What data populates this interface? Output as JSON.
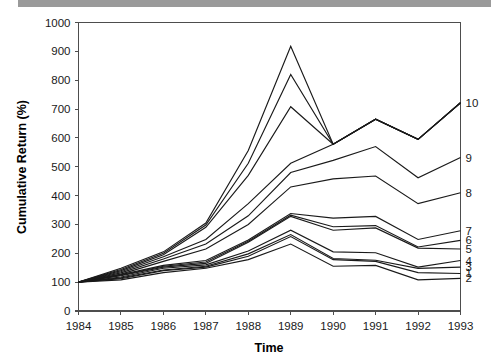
{
  "chart_data": {
    "type": "line",
    "title": "",
    "xlabel": "Time",
    "ylabel": "Cumulative Return (%)",
    "x": [
      1984,
      1985,
      1986,
      1987,
      1988,
      1989,
      1990,
      1991,
      1992,
      1993
    ],
    "categories": [
      "1984",
      "1985",
      "1986",
      "1987",
      "1988",
      "1989",
      "1990",
      "1991",
      "1992",
      "1993"
    ],
    "xticklabels": [
      "1984",
      "1985",
      "1986",
      "1987",
      "1988",
      "1989",
      "1990",
      "1991",
      "1992",
      "1993"
    ],
    "yticklabels": [
      "0",
      "100",
      "200",
      "300",
      "400",
      "500",
      "600",
      "700",
      "800",
      "900",
      "1000"
    ],
    "yticks": [
      0,
      100,
      200,
      300,
      400,
      500,
      600,
      700,
      800,
      900,
      1000
    ],
    "ylim": [
      0,
      1000
    ],
    "xlim": [
      1984,
      1993
    ],
    "grid": false,
    "legend_position": "right-edge-labels",
    "series": [
      {
        "name": "1",
        "label": "1",
        "label_value": 130,
        "values": [
          100,
          112,
          140,
          152,
          190,
          258,
          178,
          172,
          133,
          130
        ]
      },
      {
        "name": "2",
        "label": "2",
        "label_value": 113,
        "values": [
          100,
          108,
          133,
          148,
          178,
          232,
          155,
          158,
          108,
          113
        ]
      },
      {
        "name": "3",
        "label": "3",
        "label_value": 152,
        "values": [
          100,
          115,
          142,
          155,
          198,
          265,
          182,
          176,
          148,
          152
        ]
      },
      {
        "name": "4",
        "label": "4",
        "label_value": 175,
        "values": [
          100,
          118,
          148,
          160,
          208,
          280,
          205,
          202,
          152,
          175
        ]
      },
      {
        "name": "5",
        "label": "5",
        "label_value": 215,
        "values": [
          100,
          122,
          152,
          165,
          238,
          328,
          280,
          288,
          218,
          215
        ]
      },
      {
        "name": "6",
        "label": "6",
        "label_value": 245,
        "values": [
          100,
          124,
          155,
          170,
          242,
          332,
          292,
          296,
          222,
          245
        ]
      },
      {
        "name": "7",
        "label": "7",
        "label_value": 278,
        "values": [
          100,
          126,
          158,
          175,
          246,
          338,
          322,
          328,
          248,
          278
        ]
      },
      {
        "name": "8",
        "label": "8",
        "label_value": 410,
        "values": [
          100,
          128,
          172,
          215,
          300,
          430,
          458,
          468,
          372,
          410
        ]
      },
      {
        "name": "9",
        "label": "9",
        "label_value": 532,
        "values": [
          100,
          132,
          180,
          232,
          330,
          480,
          522,
          570,
          462,
          532
        ]
      },
      {
        "name": "10",
        "label": "10",
        "label_value": 722,
        "values": [
          100,
          136,
          188,
          248,
          372,
          512,
          578,
          665,
          595,
          722
        ]
      },
      {
        "name": "upper-a",
        "label": "",
        "label_value": null,
        "values": [
          100,
          140,
          195,
          290,
          470,
          708,
          578,
          665,
          595,
          722
        ]
      },
      {
        "name": "upper-b",
        "label": "",
        "label_value": null,
        "values": [
          100,
          144,
          200,
          298,
          512,
          820,
          578,
          665,
          595,
          722
        ]
      },
      {
        "name": "upper-c",
        "label": "",
        "label_value": null,
        "values": [
          100,
          148,
          205,
          305,
          556,
          918,
          578,
          665,
          595,
          722
        ]
      }
    ]
  },
  "axes": {
    "y_title": "Cumulative Return (%)",
    "x_title": "Time"
  }
}
